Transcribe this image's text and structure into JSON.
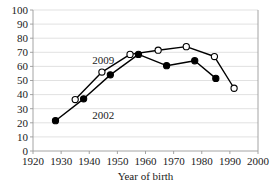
{
  "chart_data": {
    "type": "line",
    "title": "",
    "subtitle": "",
    "xlabel": "Year of birth",
    "ylabel": "",
    "xlim": [
      1920,
      2000
    ],
    "ylim": [
      0,
      100
    ],
    "xticks": [
      1920,
      1930,
      1940,
      1950,
      1960,
      1970,
      1980,
      1990,
      2000
    ],
    "xtick_labels": [
      "1920",
      "1930",
      "1940",
      "1950",
      "1960",
      "1970",
      "1980",
      "1990",
      "2000"
    ],
    "yticks": [
      0,
      10,
      20,
      30,
      40,
      50,
      60,
      70,
      80,
      90,
      100
    ],
    "ytick_labels": [
      "0",
      "10",
      "20",
      "30",
      "40",
      "50",
      "60",
      "70",
      "80",
      "90",
      "100"
    ],
    "grid": "horizontal",
    "legend_position": "inline-annotations",
    "series": [
      {
        "name": "2002",
        "marker": "filled-circle",
        "annotation": "2002",
        "annotation_x": 1945,
        "annotation_y": 23,
        "points": [
          {
            "x": 1928.0,
            "y": 21.5
          },
          {
            "x": 1938.0,
            "y": 37.0
          },
          {
            "x": 1947.5,
            "y": 54.0
          },
          {
            "x": 1957.5,
            "y": 68.5
          },
          {
            "x": 1967.5,
            "y": 60.5
          },
          {
            "x": 1977.5,
            "y": 64.0
          },
          {
            "x": 1985.0,
            "y": 51.5
          }
        ]
      },
      {
        "name": "2009",
        "marker": "open-circle",
        "annotation": "2009",
        "annotation_x": 1945,
        "annotation_y": 62,
        "points": [
          {
            "x": 1935.0,
            "y": 36.5
          },
          {
            "x": 1944.5,
            "y": 56.0
          },
          {
            "x": 1954.5,
            "y": 68.5
          },
          {
            "x": 1964.5,
            "y": 71.5
          },
          {
            "x": 1974.5,
            "y": 74.0
          },
          {
            "x": 1984.5,
            "y": 67.0
          },
          {
            "x": 1991.5,
            "y": 44.5
          }
        ]
      }
    ],
    "colors": {
      "line": "#000000",
      "grid": "#d9d9d9",
      "axis": "#9a9a9a",
      "text": "#1a1a1a",
      "background": "#ffffff"
    }
  }
}
